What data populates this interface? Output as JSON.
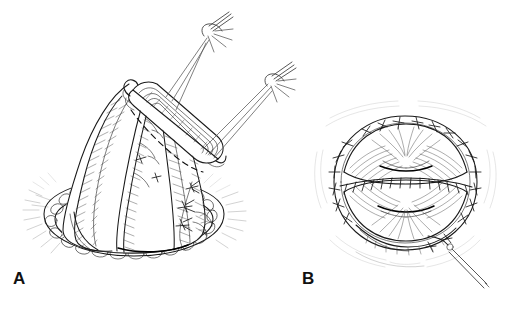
{
  "figure": {
    "type": "medical-surgical-line-illustration",
    "style": "pen-and-ink stipple and hatch drawing",
    "background_color": "#ffffff",
    "ink_color": "#1a1a1a",
    "width": 514,
    "height": 309,
    "panel_count": 2
  },
  "panels": [
    {
      "id": "A",
      "label": "A",
      "label_position": {
        "x": 13,
        "y": 270
      },
      "caption": "",
      "subject": "cone-shaped mobilized viscus elevated by apical clamp with traction sutures",
      "elements": [
        {
          "name": "organ-body",
          "description": "pear / cone shaped organ with longitudinal hatched lobes"
        },
        {
          "name": "apex-clamp",
          "description": "ribbed clamp grasping gathered tissue at apex"
        },
        {
          "name": "incision-dashed-line",
          "description": "dashed planned incision line across upper organ"
        },
        {
          "name": "traction-suture-upper",
          "description": "curved needle with trailing thread, upper left"
        },
        {
          "name": "traction-suture-lower",
          "description": "curved needle with trailing thread, upper right"
        },
        {
          "name": "fatty-tissue-bed",
          "description": "elliptical ring of cobblestone fatty tissue at base"
        },
        {
          "name": "interrupted-sutures-right",
          "description": "three interrupted knot sutures on right flank"
        },
        {
          "name": "longitudinal-vessel",
          "description": "vessel running down the anterior midline"
        }
      ]
    },
    {
      "id": "B",
      "label": "B",
      "label_position": {
        "x": 302,
        "y": 270
      },
      "caption": "",
      "subject": "completed closure viewed en face with circumferential and running sutures",
      "elements": [
        {
          "name": "closed-organ-body",
          "description": "rounded globular closed organ, radially hatched"
        },
        {
          "name": "perimeter-interrupted-sutures",
          "description": "ring of interrupted stitches around the circumference"
        },
        {
          "name": "running-suture-line",
          "description": "continuous horizontal running suture across the middle"
        },
        {
          "name": "upper-tissue-fold",
          "description": "upper crescent tissue fold with shadowed crease"
        },
        {
          "name": "lower-tissue-fold",
          "description": "lower crescent tissue fold with shadowed crease"
        },
        {
          "name": "trailing-needle",
          "description": "needle and thread exiting at lower right"
        }
      ]
    }
  ],
  "labels": {
    "panel_a": "A",
    "panel_b": "B"
  }
}
